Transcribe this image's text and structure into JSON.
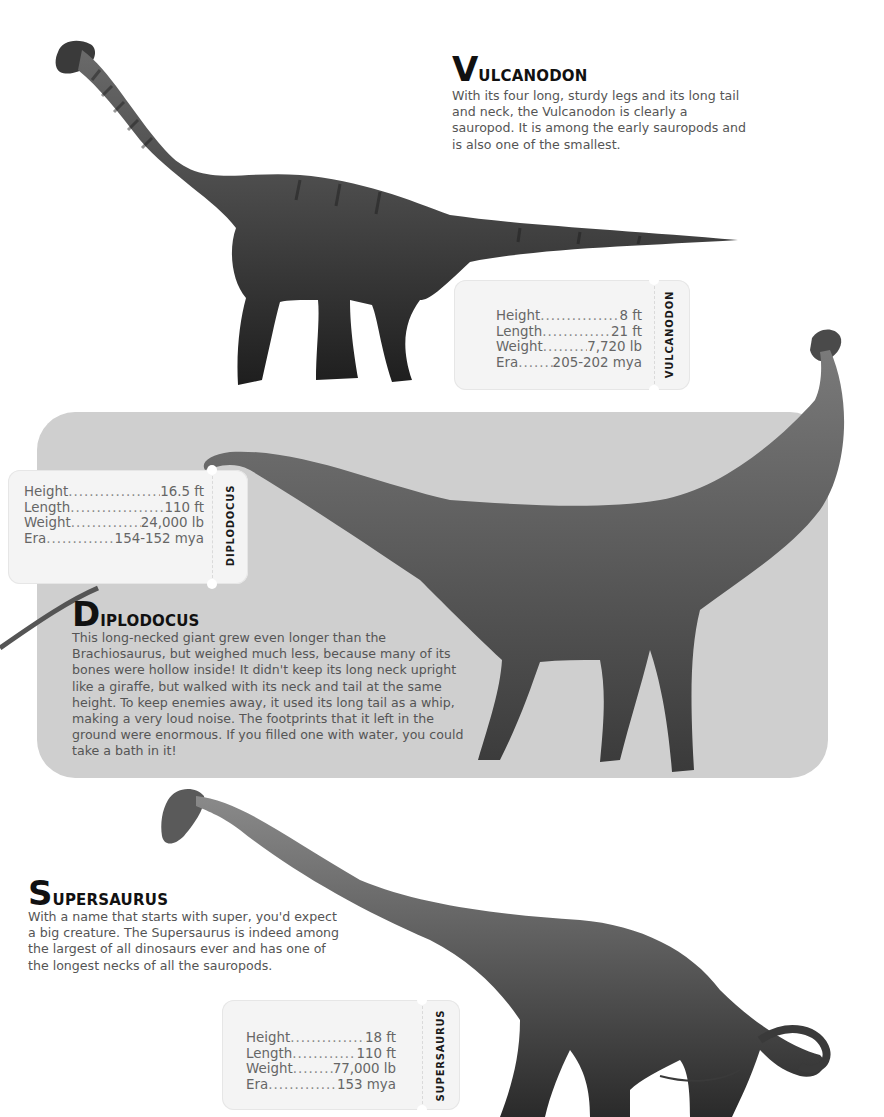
{
  "colors": {
    "page_background": "#ffffff",
    "panel_background": "#cfcfcf",
    "card_background": "#f4f4f4",
    "title_color": "#111111",
    "body_text_color": "#555555"
  },
  "dinosaurs": [
    {
      "id": "vulcanodon",
      "title_initial": "V",
      "title_rest": "ULCANODON",
      "description": "With its four long, sturdy legs and its long tail and neck, the Vulcanodon is clearly a sauropod. It is among the early sauropods and is also one of the smallest.",
      "card_label": "VULCANODON",
      "stats": [
        {
          "label": "Height",
          "value": "8 ft"
        },
        {
          "label": "Length",
          "value": "21 ft"
        },
        {
          "label": "Weight",
          "value": "7,720 lb"
        },
        {
          "label": "Era",
          "value": "205-202 mya"
        }
      ],
      "illustration": "vulcanodon-illustration"
    },
    {
      "id": "diplodocus",
      "title_initial": "D",
      "title_rest": "IPLODOCUS",
      "description": "This long-necked giant grew even longer than the Brachiosaurus, but weighed much less, because many of its bones were hollow inside! It didn't keep its long neck upright like a giraffe, but walked with its neck and tail at the same height. To keep enemies away, it used its long tail as a whip, making a very loud noise. The footprints that it left in the ground were enormous. If you filled one with water, you could take a bath in it!",
      "card_label": "DIPLODOCUS",
      "stats": [
        {
          "label": "Height",
          "value": "16.5 ft"
        },
        {
          "label": "Length",
          "value": "110 ft"
        },
        {
          "label": "Weight",
          "value": "24,000 lb"
        },
        {
          "label": "Era",
          "value": "154-152 mya"
        }
      ],
      "illustration": "diplodocus-illustration"
    },
    {
      "id": "supersaurus",
      "title_initial": "S",
      "title_rest": "UPERSAURUS",
      "description": "With a name that starts with super, you'd expect a big creature. The Supersaurus is indeed among the largest of all dinosaurs ever and has one of the longest necks of all the sauropods.",
      "card_label": "SUPERSAURUS",
      "stats": [
        {
          "label": "Height",
          "value": "18 ft"
        },
        {
          "label": "Length",
          "value": "110 ft"
        },
        {
          "label": "Weight",
          "value": "77,000 lb"
        },
        {
          "label": "Era",
          "value": "153 mya"
        }
      ],
      "illustration": "supersaurus-illustration"
    }
  ]
}
